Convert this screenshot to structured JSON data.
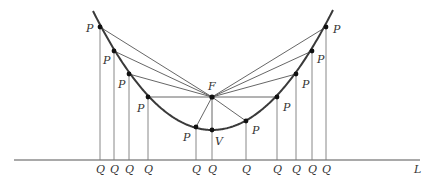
{
  "diagram": {
    "colors": {
      "curve": "#3a3a3a",
      "line": "#555555",
      "thin": "#7a7a7a",
      "point": "#111111",
      "label": "#333333"
    },
    "axis": {
      "y": 160,
      "x1": 14,
      "x2": 420,
      "label": "L",
      "label_pos": [
        414,
        173
      ]
    },
    "focus": {
      "x": 212,
      "y": 97,
      "label": "F",
      "label_pos": [
        208,
        90
      ]
    },
    "vertex": {
      "x": 212,
      "y": 130,
      "label": "V",
      "label_pos": [
        215,
        145
      ]
    },
    "parabola": {
      "from": [
        93,
        11
      ],
      "to": [
        333,
        10
      ],
      "vertex": [
        212,
        130
      ]
    },
    "points": [
      {
        "x": 100,
        "y": 27,
        "label": "P",
        "label_pos": [
          86,
          32
        ],
        "q_label": "Q",
        "q_x": 100
      },
      {
        "x": 114,
        "y": 51,
        "label": "P",
        "label_pos": [
          103,
          64
        ],
        "q_label": "Q",
        "q_x": 114
      },
      {
        "x": 129,
        "y": 74,
        "label": "P",
        "label_pos": [
          118,
          88
        ],
        "q_label": "Q",
        "q_x": 129
      },
      {
        "x": 148,
        "y": 97,
        "label": "P",
        "label_pos": [
          137,
          112
        ],
        "q_label": "Q",
        "q_x": 148
      },
      {
        "x": 196,
        "y": 127,
        "label": "P",
        "label_pos": [
          183,
          141
        ],
        "q_label": "Q",
        "q_x": 196
      },
      {
        "x": 212,
        "y": 130,
        "label": "",
        "label_pos": [
          0,
          0
        ],
        "q_label": "Q",
        "q_x": 212
      },
      {
        "x": 246,
        "y": 121,
        "label": "P",
        "label_pos": [
          252,
          134
        ],
        "q_label": "Q",
        "q_x": 246
      },
      {
        "x": 277,
        "y": 97,
        "label": "P",
        "label_pos": [
          283,
          111
        ],
        "q_label": "Q",
        "q_x": 277
      },
      {
        "x": 296,
        "y": 74,
        "label": "P",
        "label_pos": [
          302,
          88
        ],
        "q_label": "Q",
        "q_x": 296
      },
      {
        "x": 312,
        "y": 51,
        "label": "P",
        "label_pos": [
          317,
          63
        ],
        "q_label": "Q",
        "q_x": 312
      },
      {
        "x": 326,
        "y": 27,
        "label": "P",
        "label_pos": [
          333,
          33
        ],
        "q_label": "Q",
        "q_x": 326
      }
    ],
    "q_label_y": 173
  }
}
